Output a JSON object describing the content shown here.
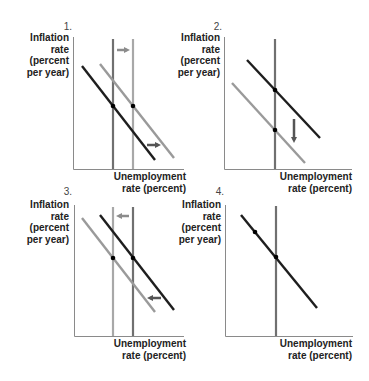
{
  "colors": {
    "axis": "#8a8a8a",
    "dark_line": "#1e1e1e",
    "light_line": "#9a9a9a",
    "vertical_dark": "#707070",
    "vertical_light": "#a8a8a8",
    "arrow_light": "#8c8c8c",
    "arrow_dark": "#555555",
    "dot": "#000000"
  },
  "axis_labels": {
    "y": [
      "Inflation",
      "rate",
      "(percent",
      "per year)"
    ],
    "x": [
      "Unemployment",
      "rate (percent)"
    ]
  },
  "panels": [
    {
      "number": "1.",
      "ylabel": {
        "l1": "Inflation",
        "l2": "rate",
        "l3": "(percent",
        "l4": "per year)"
      },
      "xlabel": {
        "l1": "Unemployment",
        "l2": "rate (percent)"
      },
      "description": "Long-run Phillips curve and short-run Phillips curve both shift right",
      "vertical_lines": [
        {
          "x": 113,
          "shade": "dark"
        },
        {
          "x": 133,
          "shade": "light"
        }
      ],
      "sloped_lines": [
        {
          "from": [
            82,
            66
          ],
          "to": [
            155,
            160
          ],
          "shade": "dark"
        },
        {
          "from": [
            100,
            64
          ],
          "to": [
            174,
            158
          ],
          "shade": "light"
        }
      ],
      "dots": [
        [
          113,
          106
        ],
        [
          133,
          106
        ]
      ],
      "arrows": [
        {
          "from": [
            117,
            50
          ],
          "to": [
            130,
            50
          ],
          "direction": "right",
          "shade": "light"
        },
        {
          "from": [
            147,
            145
          ],
          "to": [
            161,
            145
          ],
          "direction": "right",
          "shade": "dark"
        }
      ]
    },
    {
      "number": "2.",
      "ylabel": {
        "l1": "Inflation",
        "l2": "rate",
        "l3": "(percent",
        "l4": "per year)"
      },
      "xlabel": {
        "l1": "Unemployment",
        "l2": "rate (percent)"
      },
      "description": "Short-run Phillips curve shifts down along fixed long-run Phillips curve",
      "vertical_lines": [
        {
          "x": 275,
          "shade": "dark"
        }
      ],
      "sloped_lines": [
        {
          "from": [
            247,
            60
          ],
          "to": [
            320,
            138
          ],
          "shade": "dark"
        },
        {
          "from": [
            232,
            83
          ],
          "to": [
            305,
            163
          ],
          "shade": "light"
        }
      ],
      "dots": [
        [
          275,
          90
        ],
        [
          275,
          130
        ]
      ],
      "arrows": [
        {
          "from": [
            294,
            119
          ],
          "to": [
            294,
            143
          ],
          "direction": "down",
          "shade": "dark"
        }
      ]
    },
    {
      "number": "3.",
      "ylabel": {
        "l1": "Inflation",
        "l2": "rate",
        "l3": "(percent",
        "l4": "per year)"
      },
      "xlabel": {
        "l1": "Unemployment",
        "l2": "rate (percent)"
      },
      "description": "Long-run Phillips curve and short-run Phillips curve both shift left",
      "vertical_lines": [
        {
          "x": 113,
          "shade": "light"
        },
        {
          "x": 133,
          "shade": "dark"
        }
      ],
      "sloped_lines": [
        {
          "from": [
            82,
            218
          ],
          "to": [
            155,
            312
          ],
          "shade": "light"
        },
        {
          "from": [
            100,
            215
          ],
          "to": [
            174,
            310
          ],
          "shade": "dark"
        }
      ],
      "dots": [
        [
          113,
          258
        ],
        [
          133,
          258
        ]
      ],
      "arrows": [
        {
          "from": [
            129,
            216
          ],
          "to": [
            116,
            216
          ],
          "direction": "left",
          "shade": "light"
        },
        {
          "from": [
            161,
            298
          ],
          "to": [
            147,
            298
          ],
          "direction": "left",
          "shade": "dark"
        }
      ]
    },
    {
      "number": "4.",
      "ylabel": {
        "l1": "Inflation",
        "l2": "rate",
        "l3": "(percent",
        "l4": "per year)"
      },
      "xlabel": {
        "l1": "Unemployment",
        "l2": "rate (percent)"
      },
      "description": "Movement along a single short-run Phillips curve",
      "vertical_lines": [
        {
          "x": 276,
          "shade": "dark"
        }
      ],
      "sloped_lines": [
        {
          "from": [
            241,
            215
          ],
          "to": [
            317,
            308
          ],
          "shade": "dark"
        }
      ],
      "dots": [
        [
          255,
          232
        ],
        [
          276,
          257
        ]
      ],
      "arrows": []
    }
  ]
}
